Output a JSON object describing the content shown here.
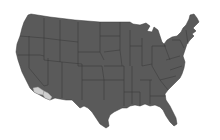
{
  "map": {
    "type": "choropleth",
    "region": "United States (contiguous)",
    "colors": {
      "background": "#ffffff",
      "default_fill": "#5a5a5a",
      "border": "#333333",
      "highlight_fill": "#cfcfcf"
    },
    "highlighted_regions": [
      {
        "name": "southern-california-coastal",
        "fill": "#cfcfcf"
      },
      {
        "name": "southern-california-border",
        "fill": "#cfcfcf"
      }
    ]
  }
}
